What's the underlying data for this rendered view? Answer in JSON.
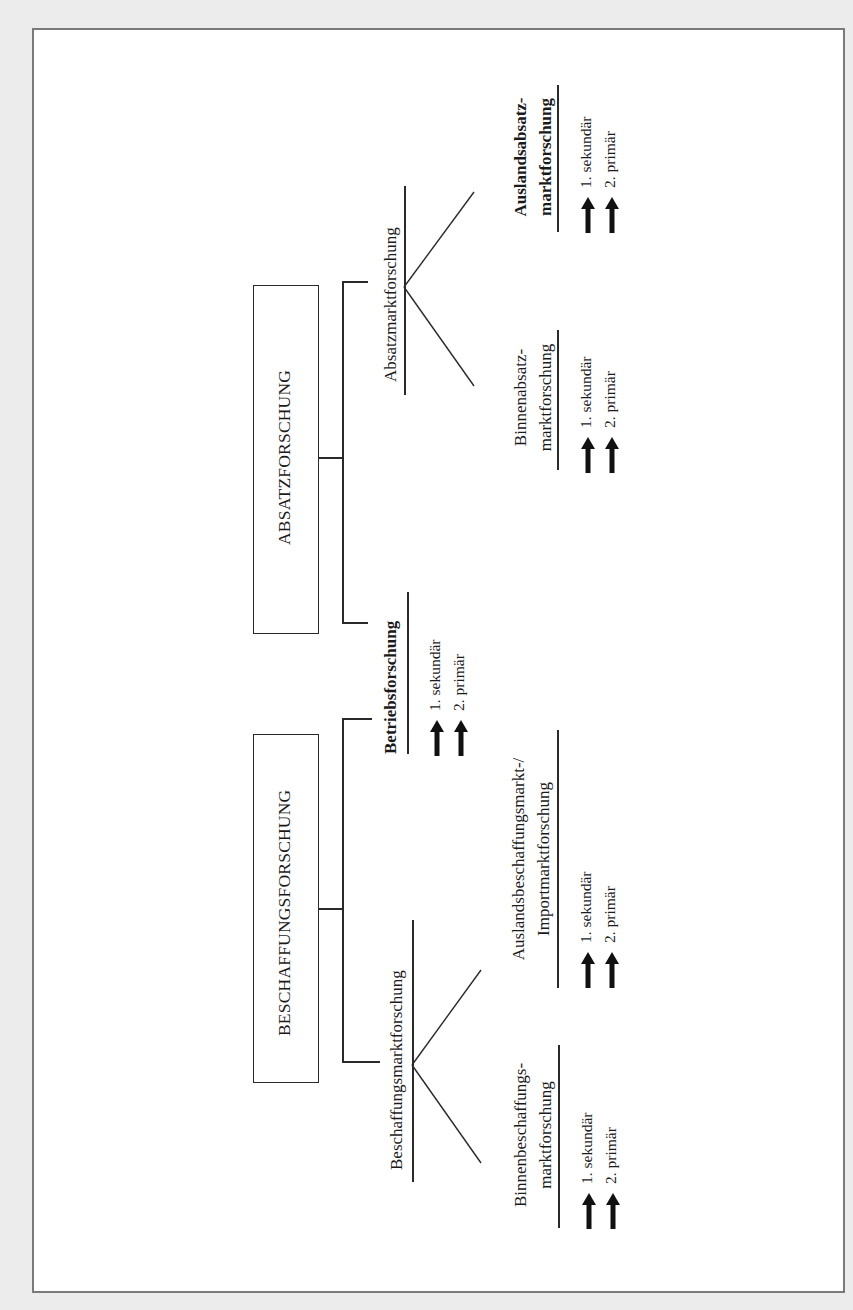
{
  "diagram": {
    "orientation": "rotated-90-ccw",
    "roots": [
      {
        "id": "absatzforschung",
        "label": "ABSATZFORSCHUNG",
        "children": [
          {
            "id": "absatzmarktforschung",
            "label": "Absatzmarktforschung",
            "children": [
              {
                "id": "binnenabsatzmarktforschung",
                "label_line1": "Binnenabsatz-",
                "label_line2": "marktforschung",
                "bold": false,
                "steps": [
                  "1. sekundär",
                  "2. primär"
                ]
              },
              {
                "id": "auslandsabsatzmarktforschung",
                "label_line1": "Auslandsabsatz-",
                "label_line2": "marktforschung",
                "bold": true,
                "steps": [
                  "1. sekundär",
                  "2. primär"
                ]
              }
            ]
          },
          {
            "id": "betriebsforschung",
            "label": "Betriebsforschung",
            "bold": true,
            "steps": [
              "1. sekundär",
              "2. primär"
            ],
            "shared_with": "beschaffungsforschung"
          }
        ]
      },
      {
        "id": "beschaffungsforschung",
        "label": "BESCHAFFUNGSFORSCHUNG",
        "children": [
          {
            "id": "beschaffungsmarktforschung",
            "label": "Beschaffungsmarktforschung",
            "children": [
              {
                "id": "binnenbeschaffungsmarktforschung",
                "label_line1": "Binnenbeschaffungs-",
                "label_line2": "marktforschung",
                "bold": false,
                "steps": [
                  "1. sekundär",
                  "2. primär"
                ]
              },
              {
                "id": "auslandsbeschaffungsmarktforschung",
                "label_line1": "Auslandsbeschaffungsmarkt-/",
                "label_line2": "Importmarktforschung",
                "bold": false,
                "steps": [
                  "1. sekundär",
                  "2. primär"
                ]
              }
            ]
          }
        ]
      }
    ]
  },
  "icons": {
    "step_arrow": "up-arrow"
  },
  "colors": {
    "page_background": "#ececec",
    "frame_border": "#7a7a7a",
    "line": "#2a2a2a",
    "text": "#1a1a1a"
  }
}
